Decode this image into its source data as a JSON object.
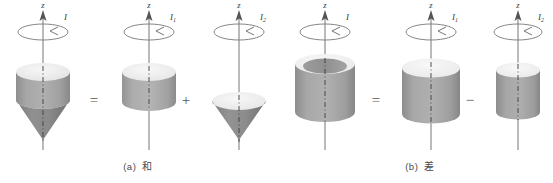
{
  "figure": {
    "title_present": false,
    "background": "#ffffff",
    "body_color": "#9a9a9a",
    "body_dark": "#7d7d7d",
    "top_face_color": "#ededed",
    "axis_color": "#555555",
    "label_color": "#3a3a3a"
  },
  "groups": [
    {
      "id": "a",
      "caption_tag": "(a)",
      "caption_text": "和",
      "operators": [
        "=",
        "+"
      ],
      "units": [
        {
          "id": "a1",
          "axis_label": "z",
          "moment_label": "I",
          "moment_sub": "",
          "shape": "cylinder-with-cone",
          "shape_name": "cylinder-plus-cone-body"
        },
        {
          "id": "a2",
          "axis_label": "z",
          "moment_label": "I",
          "moment_sub": "1",
          "shape": "cylinder",
          "shape_name": "short-cylinder-body"
        },
        {
          "id": "a3",
          "axis_label": "z",
          "moment_label": "I",
          "moment_sub": "2",
          "shape": "cone",
          "shape_name": "inverted-cone-body"
        }
      ]
    },
    {
      "id": "b",
      "caption_tag": "(b)",
      "caption_text": "差",
      "operators": [
        "=",
        "−"
      ],
      "units": [
        {
          "id": "b1",
          "axis_label": "z",
          "moment_label": "I",
          "moment_sub": "",
          "shape": "hollow-cylinder",
          "shape_name": "hollow-tube-body"
        },
        {
          "id": "b2",
          "axis_label": "z",
          "moment_label": "I",
          "moment_sub": "1",
          "shape": "cylinder",
          "shape_name": "wide-cylinder-body"
        },
        {
          "id": "b3",
          "axis_label": "z",
          "moment_label": "I",
          "moment_sub": "2",
          "shape": "cylinder",
          "shape_name": "narrow-cylinder-body"
        }
      ]
    }
  ],
  "icons": {
    "axis_arrow": "up-arrow-icon",
    "rotation": "rotation-arrow-icon",
    "dash_axis": "dash-dot-axis-icon"
  }
}
